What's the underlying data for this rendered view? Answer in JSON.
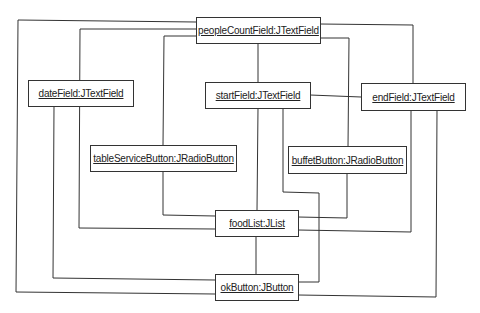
{
  "diagram": {
    "type": "uml-object-diagram",
    "line_color": "#333333",
    "nodes": [
      {
        "id": "peopleCount",
        "label": "peopleCountField:JTextField"
      },
      {
        "id": "date",
        "label": "dateField:JTextField"
      },
      {
        "id": "start",
        "label": "startField:JTextField"
      },
      {
        "id": "end",
        "label": "endField:JTextField"
      },
      {
        "id": "tableService",
        "label": "tableServiceButton:JRadioButton"
      },
      {
        "id": "buffet",
        "label": "buffetButton:JRadioButton"
      },
      {
        "id": "foodList",
        "label": "foodList:JList"
      },
      {
        "id": "ok",
        "label": "okButton:JButton"
      }
    ],
    "links": [
      {
        "from": "peopleCount",
        "to": "ok"
      },
      {
        "from": "peopleCount",
        "to": "foodList"
      },
      {
        "from": "peopleCount",
        "to": "tableService"
      },
      {
        "from": "peopleCount",
        "to": "start"
      },
      {
        "from": "peopleCount",
        "to": "end"
      },
      {
        "from": "peopleCount",
        "to": "buffet"
      },
      {
        "from": "date",
        "to": "ok"
      },
      {
        "from": "start",
        "to": "end"
      },
      {
        "from": "start",
        "to": "foodList"
      },
      {
        "from": "start",
        "to": "ok"
      },
      {
        "from": "tableService",
        "to": "foodList"
      },
      {
        "from": "buffet",
        "to": "foodList"
      },
      {
        "from": "end",
        "to": "foodList"
      },
      {
        "from": "end",
        "to": "ok"
      },
      {
        "from": "foodList",
        "to": "ok"
      }
    ]
  }
}
